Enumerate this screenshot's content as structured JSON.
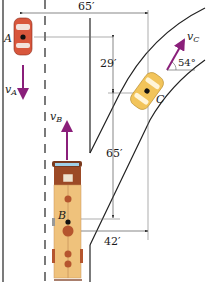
{
  "diagram": {
    "dimensions": {
      "horizontal_top": "65′",
      "vertical_upper": "29′",
      "vertical_lower": "65′",
      "horizontal_bottom": "42′"
    },
    "angle": "54°",
    "vehicles": {
      "A": {
        "label": "A",
        "velocity_label": "v",
        "velocity_sub": "A"
      },
      "B": {
        "label": "B",
        "velocity_label": "v",
        "velocity_sub": "B"
      },
      "C": {
        "label": "C",
        "velocity_label": "v",
        "velocity_sub": "C"
      }
    },
    "colors": {
      "arrow": "#8a1f7a",
      "car_a": "#d8563c",
      "car_c": "#f2c45a",
      "bus_body": "#efc27c",
      "bus_dark": "#9c4a26",
      "line": "#222222",
      "dim_line": "#555555"
    }
  }
}
